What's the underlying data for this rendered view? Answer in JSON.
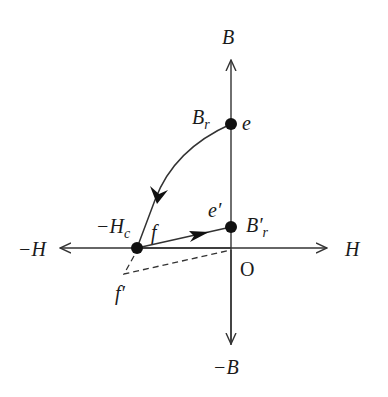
{
  "diagram": {
    "type": "B-H hysteresis demagnetization diagram",
    "axes": {
      "vertical_positive_label": "B",
      "vertical_negative_label": "−B",
      "horizontal_positive_label": "H",
      "horizontal_negative_label": "−H",
      "origin_label": "O"
    },
    "points": {
      "e": {
        "label": "e",
        "value_label": "B",
        "value_sub": "r"
      },
      "f": {
        "label": "f",
        "value_label": "−H",
        "value_sub": "c"
      },
      "e_prime": {
        "label": "e′",
        "value_label": "B′",
        "value_sub": "r"
      },
      "f_prime": {
        "label": "f′"
      }
    },
    "colors": {
      "stroke": "#333333",
      "point": "#111111",
      "background": "#ffffff"
    }
  }
}
